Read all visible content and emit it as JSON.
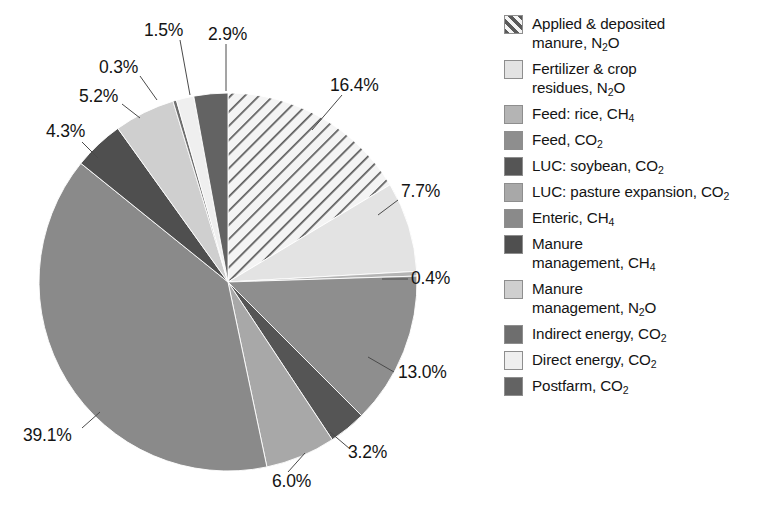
{
  "chart_data": {
    "type": "pie",
    "title": "",
    "unit": "%",
    "legend_position": "right",
    "center": {
      "x": 228,
      "y": 282
    },
    "radius": 189,
    "start_angle_deg": 0,
    "direction": "clockwise",
    "categories": [
      "Applied & deposited manure, N2O",
      "Fertilizer & crop residues, N2O",
      "Feed: rice, CH4",
      "Feed, CO2",
      "LUC: soybean, CO2",
      "LUC: pasture expansion, CO2",
      "Enteric, CH4",
      "Manure management, CH4",
      "Manure management, N2O",
      "Indirect energy, CO2",
      "Direct energy, CO2",
      "Postfarm, CO2"
    ],
    "values": [
      16.4,
      7.7,
      0.4,
      13.0,
      3.2,
      6.0,
      39.1,
      4.3,
      5.2,
      0.3,
      1.5,
      2.9
    ],
    "value_labels": [
      "16.4%",
      "7.7%",
      "0.4%",
      "13.0%",
      "3.2%",
      "6.0%",
      "39.1%",
      "4.3%",
      "5.2%",
      "0.3%",
      "1.5%",
      "2.9%"
    ],
    "slice_colors": [
      "#f2f2f2",
      "#e3e3e3",
      "#b4b4b4",
      "#8e8e8e",
      "#555555",
      "#a8a8a8",
      "#8a8a8a",
      "#4f4f4f",
      "#cfcfcf",
      "#6e6e6e",
      "#efefef",
      "#636363"
    ],
    "slice_patterns": [
      "diagonal-hatch",
      "solid",
      "solid",
      "solid",
      "solid",
      "solid",
      "solid",
      "solid",
      "solid",
      "solid",
      "solid",
      "solid"
    ]
  },
  "slices": [
    {
      "label": "16.4%",
      "legend": {
        "line1": "Applied & deposited",
        "line2_pre": "manure, N",
        "line2_sub": "2",
        "line2_post": "O"
      },
      "swatch": "#f2f2f2",
      "pattern": "diagonal-hatch",
      "label_pos": {
        "left": 330,
        "top": 77
      },
      "leader": {
        "x1": 342,
        "y1": 95,
        "x2": 312,
        "y2": 130
      }
    },
    {
      "label": "7.7%",
      "legend": {
        "line1": "Fertilizer & crop",
        "line2_pre": "residues, N",
        "line2_sub": "2",
        "line2_post": "O"
      },
      "swatch": "#e3e3e3",
      "pattern": "solid",
      "label_pos": {
        "left": 401,
        "top": 183
      },
      "leader": {
        "x1": 398,
        "y1": 200,
        "x2": 378,
        "y2": 215
      }
    },
    {
      "label": "0.4%",
      "legend": {
        "line1": "Feed: rice, CH",
        "line1_sub": "4",
        "line2_pre": "",
        "line2_sub": "",
        "line2_post": ""
      },
      "swatch": "#b4b4b4",
      "pattern": "solid",
      "label_pos": {
        "left": 411,
        "top": 270
      },
      "leader": {
        "x1": 408,
        "y1": 279,
        "x2": 382,
        "y2": 279
      }
    },
    {
      "label": "13.0%",
      "legend": {
        "line1": "Feed, CO",
        "line1_sub": "2",
        "line2_pre": "",
        "line2_sub": "",
        "line2_post": ""
      },
      "swatch": "#8e8e8e",
      "pattern": "solid",
      "label_pos": {
        "left": 398,
        "top": 364
      },
      "leader": {
        "x1": 394,
        "y1": 372,
        "x2": 368,
        "y2": 357
      }
    },
    {
      "label": "3.2%",
      "legend": {
        "line1": "LUC: soybean, CO",
        "line1_sub": "2",
        "line2_pre": "",
        "line2_sub": "",
        "line2_post": ""
      },
      "swatch": "#555555",
      "pattern": "solid",
      "label_pos": {
        "left": 348,
        "top": 444
      },
      "leader": {
        "x1": 350,
        "y1": 449,
        "x2": 330,
        "y2": 432
      }
    },
    {
      "label": "6.0%",
      "legend": {
        "line1": "LUC: pasture expansion, CO",
        "line1_sub": "2",
        "line2_pre": "",
        "line2_sub": "",
        "line2_post": ""
      },
      "swatch": "#a8a8a8",
      "pattern": "solid",
      "label_pos": {
        "left": 272,
        "top": 473
      },
      "leader": {
        "x1": 288,
        "y1": 472,
        "x2": 305,
        "y2": 453
      }
    },
    {
      "label": "39.1%",
      "legend": {
        "line1": "Enteric, CH",
        "line1_sub": "4",
        "line2_pre": "",
        "line2_sub": "",
        "line2_post": ""
      },
      "swatch": "#8a8a8a",
      "pattern": "solid",
      "label_pos": {
        "left": 23,
        "top": 427
      },
      "leader": {
        "x1": 82,
        "y1": 428,
        "x2": 100,
        "y2": 412
      }
    },
    {
      "label": "4.3%",
      "legend": {
        "line1": "Manure",
        "line2_pre": "management, CH",
        "line2_sub": "4",
        "line2_post": ""
      },
      "swatch": "#4f4f4f",
      "pattern": "solid",
      "label_pos": {
        "left": 46,
        "top": 123
      },
      "leader": {
        "x1": 82,
        "y1": 142,
        "x2": 98,
        "y2": 158
      }
    },
    {
      "label": "5.2%",
      "legend": {
        "line1": "Manure",
        "line2_pre": "management, N",
        "line2_sub": "2",
        "line2_post": "O"
      },
      "swatch": "#cfcfcf",
      "pattern": "solid",
      "label_pos": {
        "left": 79,
        "top": 88
      },
      "leader": {
        "x1": 122,
        "y1": 104,
        "x2": 140,
        "y2": 118
      }
    },
    {
      "label": "0.3%",
      "legend": {
        "line1": "Indirect energy, CO",
        "line1_sub": "2",
        "line2_pre": "",
        "line2_sub": "",
        "line2_post": ""
      },
      "swatch": "#6e6e6e",
      "pattern": "solid",
      "label_pos": {
        "left": 99,
        "top": 59
      },
      "leader": {
        "x1": 140,
        "y1": 76,
        "x2": 157,
        "y2": 100
      }
    },
    {
      "label": "1.5%",
      "legend": {
        "line1": "Direct energy, CO",
        "line1_sub": "2",
        "line2_pre": "",
        "line2_sub": "",
        "line2_post": ""
      },
      "swatch": "#efefef",
      "pattern": "solid",
      "label_pos": {
        "left": 144,
        "top": 22
      },
      "leader": {
        "x1": 180,
        "y1": 40,
        "x2": 190,
        "y2": 95
      }
    },
    {
      "label": "2.9%",
      "legend": {
        "line1": "Postfarm, CO",
        "line1_sub": "2",
        "line2_pre": "",
        "line2_sub": "",
        "line2_post": ""
      },
      "swatch": "#636363",
      "pattern": "solid",
      "label_pos": {
        "left": 208,
        "top": 26
      },
      "leader": {
        "x1": 226,
        "y1": 44,
        "x2": 226,
        "y2": 91
      }
    }
  ]
}
